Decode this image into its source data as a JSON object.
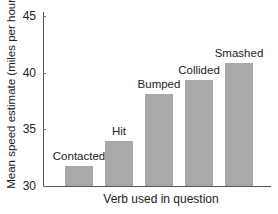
{
  "chart_data": {
    "type": "bar",
    "title": "",
    "xlabel": "Verb used in question",
    "ylabel": "Mean speed estimate (miles per hour)",
    "categories": [
      "Contacted",
      "Hit",
      "Bumped",
      "Collided",
      "Smashed"
    ],
    "values": [
      31.8,
      34.0,
      38.1,
      39.3,
      40.8
    ],
    "ylim": [
      30,
      45
    ],
    "yticks": [
      30,
      35,
      40,
      45
    ],
    "grid": false,
    "legend": null,
    "bar_color": "#a9a9a9",
    "data_labels_are_category_names": true
  },
  "axes": {
    "xlabel": "Verb used in question",
    "ylabel": "Mean speed estimate (miles per hour)",
    "yticks": [
      "30",
      "35",
      "40",
      "45"
    ]
  },
  "bars": [
    {
      "label": "Contacted",
      "value": 31.8
    },
    {
      "label": "Hit",
      "value": 34.0
    },
    {
      "label": "Bumped",
      "value": 38.1
    },
    {
      "label": "Collided",
      "value": 39.3
    },
    {
      "label": "Smashed",
      "value": 40.8
    }
  ]
}
